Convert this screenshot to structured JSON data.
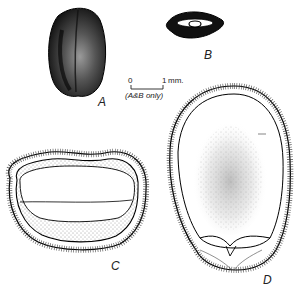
{
  "figure": {
    "panels": [
      {
        "id": "A",
        "label": "A",
        "description": "whole seed, external view"
      },
      {
        "id": "B",
        "label": "B",
        "description": "seed, cross-section small scale"
      },
      {
        "id": "C",
        "label": "C",
        "description": "transverse section of seed"
      },
      {
        "id": "D",
        "label": "D",
        "description": "longitudinal section of seed"
      }
    ],
    "scale_bar": {
      "start": "0",
      "end": "1",
      "unit": "mm.",
      "caption": "(A&B only)"
    }
  }
}
